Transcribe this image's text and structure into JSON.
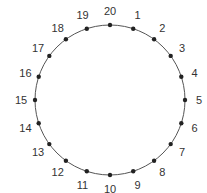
{
  "diagram": {
    "type": "circular-points",
    "center": [
      110,
      100
    ],
    "radius": 75,
    "line_color": "#555555",
    "dot_color": "#222222",
    "points": [
      {
        "label": "1"
      },
      {
        "label": "2"
      },
      {
        "label": "3"
      },
      {
        "label": "4"
      },
      {
        "label": "5"
      },
      {
        "label": "6"
      },
      {
        "label": "7"
      },
      {
        "label": "8"
      },
      {
        "label": "9"
      },
      {
        "label": "10"
      },
      {
        "label": "11"
      },
      {
        "label": "12"
      },
      {
        "label": "13"
      },
      {
        "label": "14"
      },
      {
        "label": "15"
      },
      {
        "label": "16"
      },
      {
        "label": "17"
      },
      {
        "label": "18"
      },
      {
        "label": "19"
      },
      {
        "label": "20"
      }
    ]
  }
}
